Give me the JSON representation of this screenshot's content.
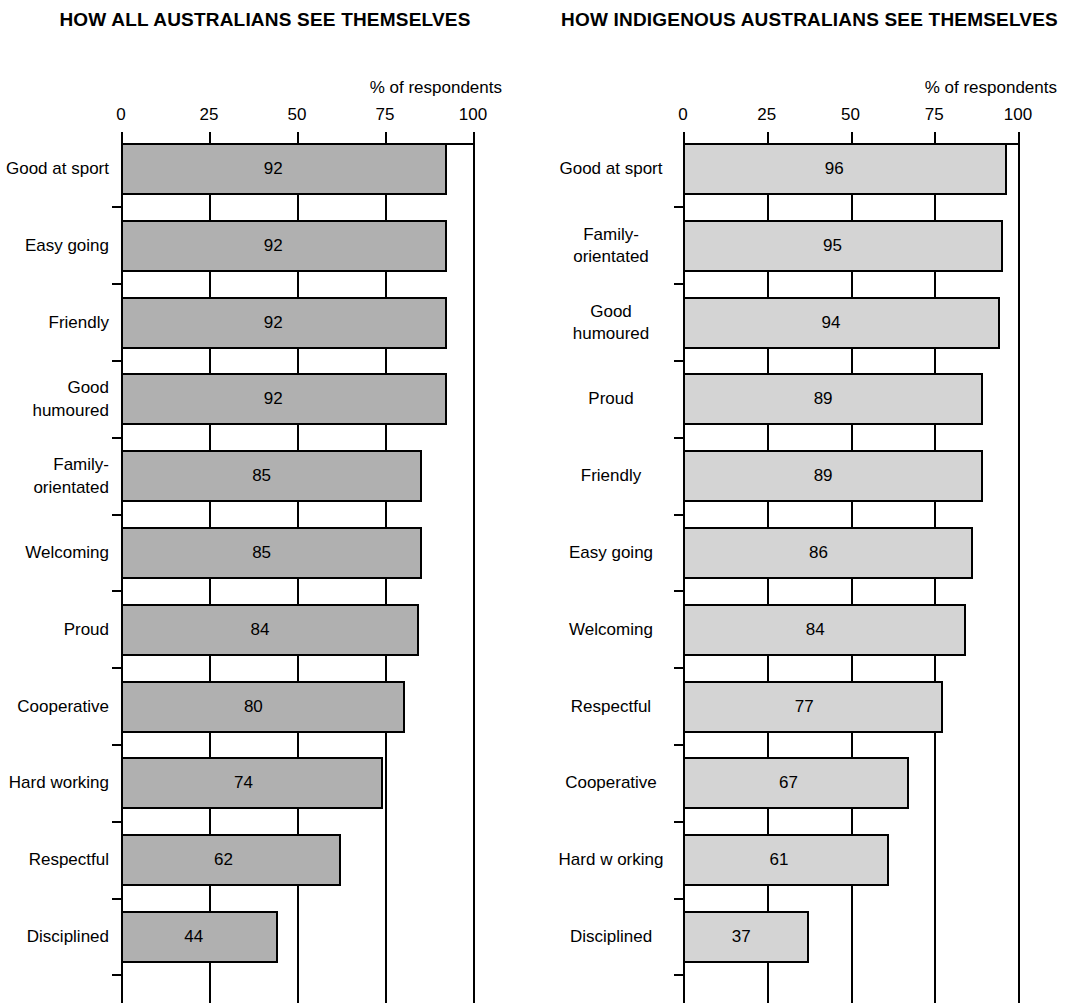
{
  "charts": [
    {
      "title": "HOW ALL AUSTRALIANS SEE\nTHEMSELVES",
      "axis_caption": "% of respondents",
      "bar_fill": "#b0b0b0",
      "label_align": "right"
    },
    {
      "title": "HOW INDIGENOUS AUSTRALIANS\nSEE THEMSELVES",
      "axis_caption": "% of respondents",
      "bar_fill": "#d4d4d4",
      "label_align": "center"
    }
  ],
  "chart_data": [
    {
      "type": "bar",
      "orientation": "horizontal",
      "title": "HOW ALL AUSTRALIANS SEE THEMSELVES",
      "xlabel": "% of respondents",
      "ylabel": "",
      "xlim": [
        0,
        100
      ],
      "xticks": [
        0,
        25,
        50,
        75,
        100
      ],
      "xticklabels": [
        "0",
        "25",
        "50",
        "75",
        "100"
      ],
      "grid": true,
      "legend": false,
      "bar_color": "#b0b0b0",
      "data_labels": true,
      "categories": [
        "Good at sport",
        "Easy going",
        "Friendly",
        "Good\nhumoured",
        "Family-\norientated",
        "Welcoming",
        "Proud",
        "Cooperative",
        "Hard working",
        "Respectful",
        "Disciplined"
      ],
      "values": [
        92,
        92,
        92,
        92,
        85,
        85,
        84,
        80,
        74,
        62,
        44
      ]
    },
    {
      "type": "bar",
      "orientation": "horizontal",
      "title": "HOW INDIGENOUS AUSTRALIANS SEE THEMSELVES",
      "xlabel": "% of respondents",
      "ylabel": "",
      "xlim": [
        0,
        100
      ],
      "xticks": [
        0,
        25,
        50,
        75,
        100
      ],
      "xticklabels": [
        "0",
        "25",
        "50",
        "75",
        "100"
      ],
      "grid": true,
      "legend": false,
      "bar_color": "#d4d4d4",
      "data_labels": true,
      "categories": [
        "Good at sport",
        "Family-\norientated",
        "Good\nhumoured",
        "Proud",
        "Friendly",
        "Easy going",
        "Welcoming",
        "Respectful",
        "Cooperative",
        "Hard w orking",
        "Disciplined"
      ],
      "values": [
        96,
        95,
        94,
        89,
        89,
        86,
        84,
        77,
        67,
        61,
        37
      ]
    }
  ]
}
